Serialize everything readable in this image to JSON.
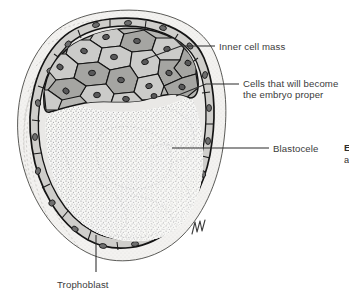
{
  "figure": {
    "style": "grayscale pen-and-ink stipple illustration",
    "background_color": "#ffffff",
    "ink_color": "#1a1a1a",
    "text_color": "#3b3b3b"
  },
  "labels": [
    {
      "id": "inner-cell-mass",
      "text": "Inner cell mass",
      "x": 219,
      "y": 41,
      "leader": {
        "x1": 181,
        "y1": 46,
        "x2": 215,
        "y2": 46,
        "target_x": 143,
        "target_y": 60
      }
    },
    {
      "id": "cells-embryo-proper",
      "text_line1": "Cells that will become",
      "text_line2": "the embryo proper",
      "x": 243,
      "y": 78,
      "leader": {
        "x1": 206,
        "y1": 84,
        "x2": 239,
        "y2": 84,
        "target_x": 176,
        "target_y": 96
      }
    },
    {
      "id": "blastocele",
      "text": "Blastocele",
      "x": 273,
      "y": 143,
      "leader": {
        "x1": 172,
        "y1": 148,
        "x2": 269,
        "y2": 148
      }
    },
    {
      "id": "trophoblast",
      "text": "Trophoblast",
      "x": 57,
      "y": 279,
      "leader": {
        "x1": 96,
        "y1": 235,
        "x2": 96,
        "y2": 272
      }
    }
  ],
  "cropped_edge_fragments": {
    "bold_fragment": "E",
    "plain_fragment": "a"
  },
  "structures": {
    "zona_pellucida": {
      "name": "zona pellucida",
      "fill": "#f2f1ef",
      "stroke": "#3b3b3b",
      "note": "translucent outer membrane with fine dotted texture"
    },
    "trophoblast": {
      "name": "trophoblast",
      "fill": "#c6c5c2",
      "stroke": "#1a1a1a",
      "note": "thin outer layer of flattened cells with dark nuclei"
    },
    "inner_cell_mass": {
      "name": "inner cell mass",
      "fill_light": "#c9c9c7",
      "fill_dark": "#9b9b98",
      "stroke": "#1a1a1a",
      "note": "cluster of polygonal cells with oval nuclei at upper pole"
    },
    "blastocele": {
      "name": "blastocele",
      "fill": "#f6f6f4",
      "note": "fluid-filled cavity rendered as graded stipple"
    }
  },
  "signature": {
    "present": true,
    "x": 196,
    "y": 228,
    "note": "artist monogram"
  }
}
